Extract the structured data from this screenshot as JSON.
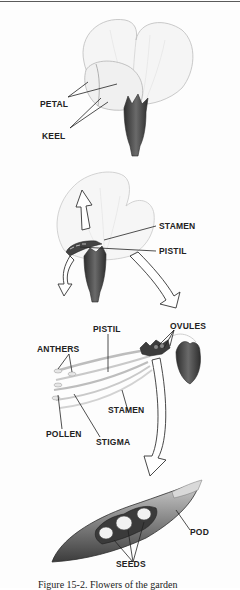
{
  "figure": {
    "caption": "Figure 15-2. Flowers of the garden",
    "panels": [
      {
        "id": "intact-flower",
        "labels": {
          "petal": "PETAL",
          "keel": "KEEL"
        }
      },
      {
        "id": "opened-flower",
        "labels": {
          "stamen": "STAMEN",
          "pistil": "PISTIL"
        }
      },
      {
        "id": "reproductive-parts",
        "labels": {
          "pistil": "PISTIL",
          "ovules": "OVULES",
          "anthers": "ANTHERS",
          "pollen": "POLLEN",
          "stigma": "STIGMA",
          "stamen": "STAMEN"
        }
      },
      {
        "id": "pea-pod",
        "labels": {
          "pod": "POD",
          "seeds": "SEEDS"
        }
      }
    ]
  },
  "colors": {
    "ink": "#222222",
    "sepal": "#4a4a4a",
    "petal_fill": "#f4f4f4",
    "pod_fill": "#8c8c8c",
    "seed_fill": "#f2f2f2"
  }
}
